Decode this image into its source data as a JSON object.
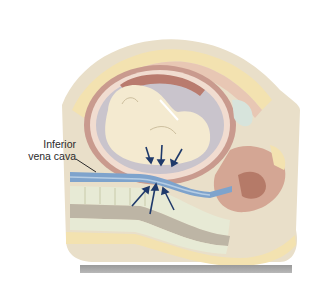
{
  "figure": {
    "labels": [
      {
        "id": "ivc",
        "line1": "Inferior",
        "line2": "vena cava"
      }
    ],
    "arrows": {
      "downward_count": 3,
      "upward_count": 3,
      "color": "#1f3a6b"
    },
    "colors": {
      "skin_outer": "#e9dfc9",
      "abdominal_wall": "#f3e2b0",
      "uterine_wall": "#c99a8e",
      "amniotic": "#c9c4cc",
      "fetus": "#f4ead0",
      "vena_cava": "#7ea3cc",
      "spine": "#e7ead5",
      "floor": "#a3a3a3"
    }
  }
}
